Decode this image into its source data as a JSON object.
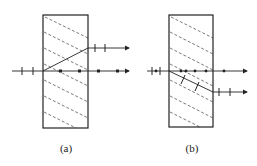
{
  "figure": {
    "panels": [
      {
        "id": "a",
        "caption": "(a)",
        "description": "Birefringent crystal slab; incident ray splits into o-ray (dots, straight through) and e-ray (dashes, deflected upward)"
      },
      {
        "id": "b",
        "caption": "(b)",
        "description": "Birefringent crystal slab; incident ray splits into o-ray (dots, straight through) and e-ray (dashes, deflected downward)"
      }
    ],
    "colors": {
      "line": "#222222",
      "background": "#ffffff"
    }
  }
}
